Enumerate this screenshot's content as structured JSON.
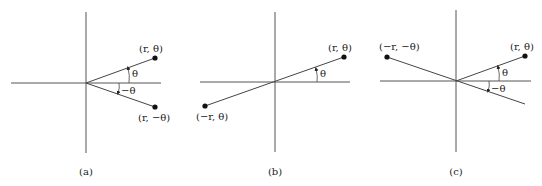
{
  "figure": {
    "panels": [
      {
        "caption": "(a)",
        "points": [
          {
            "label": "(r, θ)"
          },
          {
            "label": "(r, −θ)"
          }
        ],
        "angles": [
          "θ",
          "−θ"
        ]
      },
      {
        "caption": "(b)",
        "points": [
          {
            "label": "(r, θ)"
          },
          {
            "label": "(−r, θ)"
          }
        ],
        "angles": [
          "θ"
        ]
      },
      {
        "caption": "(c)",
        "points": [
          {
            "label": "(r, θ)"
          },
          {
            "label": "(−r, −θ)"
          }
        ],
        "angles": [
          "θ",
          "−θ"
        ]
      }
    ]
  }
}
